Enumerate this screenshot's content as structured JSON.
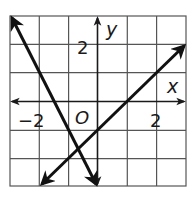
{
  "graph": {
    "x_axis_label": "x",
    "y_axis_label": "y",
    "origin_label": "O",
    "tick_labels": {
      "x_neg": "−2",
      "x_pos": "2",
      "y_pos": "2"
    },
    "grid": {
      "x_range": [
        -3,
        3
      ],
      "y_range": [
        -3,
        3
      ],
      "step": 1
    },
    "lines": [
      {
        "name": "decreasing-line",
        "equation": "y = -2x - 3",
        "from": [
          -3,
          3
        ],
        "to": [
          0,
          -3
        ]
      },
      {
        "name": "increasing-line",
        "equation": "y = x - 1",
        "from": [
          -2,
          -3
        ],
        "to": [
          3,
          2
        ]
      }
    ],
    "colors": {
      "grid": "#555555",
      "axes": "#1a1a1a",
      "lines": "#111111"
    }
  }
}
